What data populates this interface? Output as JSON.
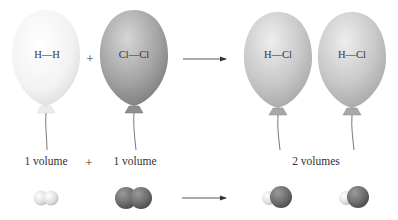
{
  "diagram": {
    "reactants": [
      {
        "formula": "H—H",
        "volume_label": "1 volume",
        "color": "#f2f2f2"
      },
      {
        "formula": "Cl—Cl",
        "volume_label": "1 volume",
        "color": "#9a9a9a"
      }
    ],
    "products": [
      {
        "formula": "H—Cl",
        "color": "#c8c8c8"
      },
      {
        "formula": "H—Cl",
        "color": "#c8c8c8"
      }
    ],
    "product_volume_label": "2 volumes",
    "plus_sign": "+",
    "colors": {
      "hydrogen_atom": "#eeeeee",
      "chlorine_atom": "#6e6e6e",
      "arrow": "#333333",
      "string": "#555555"
    }
  }
}
